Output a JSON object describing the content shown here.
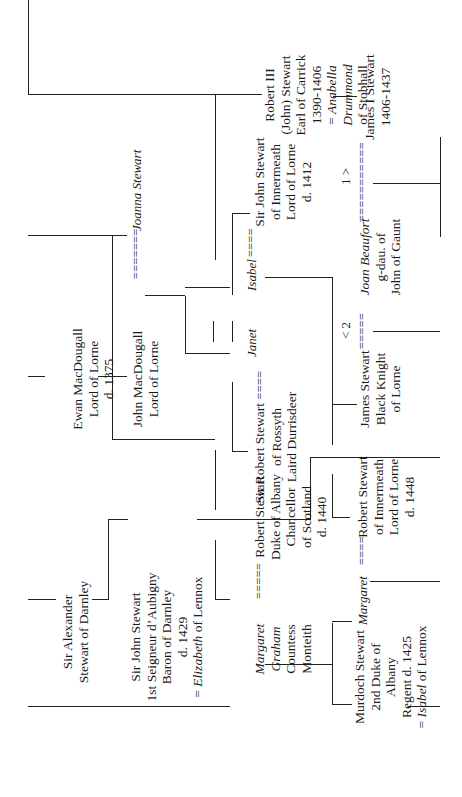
{
  "diagram": {
    "type": "genealogy-tree",
    "people": {
      "ewan": [
        "Ewan MacDougall",
        "Lord of Lorne",
        "d. 1375"
      ],
      "john_macdougall": [
        "John MacDougall",
        "Lord of Lorne"
      ],
      "joanna": "Joanna Stewart",
      "alexander": [
        "Sir Alexander",
        "Stewart of Darnley"
      ],
      "john_darnley": [
        "Sir John Stewart",
        "1st Seigneur d’Aubigny",
        "Baron of Darnley",
        "d. 1429"
      ],
      "john_darnley_spouse_prefix": "= ",
      "john_darnley_spouse_name": "Elizabeth",
      "john_darnley_spouse_suffix": " of Lennox",
      "robert_iii": [
        "Robert III",
        "(John) Stewart",
        "Earl of Carrick",
        "1390-1406"
      ],
      "robert_iii_spouse_prefix": "= ",
      "robert_iii_spouse": [
        "Anabella",
        "Drummond"
      ],
      "robert_iii_spouse_suffix": "of Stobhall",
      "james_i": [
        "James I Stewart",
        "1406-1437"
      ],
      "janet": "Janet",
      "isabel": "Isabel",
      "robert_rossyth": [
        "Sir Robert Stewart",
        "of Rossyth",
        "Laird Durrisdeer"
      ],
      "john_innermeath": [
        "Sir John Stewart",
        "of Innermeath",
        "Lord of Lorne",
        "d. 1412"
      ],
      "joan_beaufort_name": "Joan Beaufort",
      "joan_beaufort": [
        "g-dau. of",
        "John of Gaunt"
      ],
      "james_black_knight": [
        "James Stewart",
        "Black Knight",
        "of Lorne"
      ],
      "margaret_graham_name": [
        "Margaret",
        "Graham"
      ],
      "margaret_graham": [
        "Countess",
        "Monteith"
      ],
      "robert_albany": [
        "Robert Stewart",
        "Duke of Albany",
        "Chancellor",
        "of Scotland",
        "d. 1440"
      ],
      "margaret": "Margaret",
      "robert_innermeath": [
        "Robert Stewart",
        "of Innermeath",
        "Lord of Lorne",
        "d. 1448"
      ],
      "murdoch": [
        "Murdoch Stewart",
        "2nd Duke of",
        "Albany",
        "Regent d. 1425"
      ],
      "murdoch_spouse_prefix": "= ",
      "murdoch_spouse_name": "Isabel",
      "murdoch_spouse_suffix": " of Lennox"
    },
    "marriage_marks": {
      "macdougall_joanna": "=======",
      "robert_janet": "====",
      "isabel_john": "====",
      "james_joan": "=====",
      "joan_james_i": "===========",
      "margaret_robert": "=====",
      "margaret_robert_innermeath": "===="
    },
    "order_labels": {
      "first": "1 >",
      "second": "< 2"
    }
  }
}
